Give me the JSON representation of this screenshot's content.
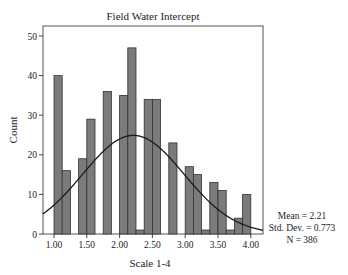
{
  "chart_data": {
    "type": "bar",
    "subtype": "histogram",
    "title": "Field Water Intercept",
    "xlabel": "Scale 1-4",
    "ylabel": "Count",
    "xlim": [
      0.83,
      4.18
    ],
    "ylim": [
      0,
      52
    ],
    "x_ticks": [
      "1.00",
      "1.50",
      "2.00",
      "2.50",
      "3.00",
      "3.50",
      "4.00"
    ],
    "x_tick_values": [
      1.0,
      1.5,
      2.0,
      2.5,
      3.0,
      3.5,
      4.0
    ],
    "y_ticks": [
      0,
      10,
      20,
      30,
      40,
      50
    ],
    "bin_width": 0.125,
    "bin_starts": [
      1.0,
      1.125,
      1.25,
      1.375,
      1.5,
      1.625,
      1.75,
      1.875,
      2.0,
      2.125,
      2.25,
      2.375,
      2.5,
      2.625,
      2.75,
      2.875,
      3.0,
      3.125,
      3.25,
      3.375,
      3.5,
      3.625,
      3.75,
      3.875
    ],
    "values": [
      40,
      16,
      0,
      19,
      29,
      0,
      36,
      0,
      35,
      47,
      1,
      34,
      34,
      0,
      23,
      0,
      17,
      15,
      1,
      13,
      11,
      1,
      4,
      10
    ],
    "normal_curve": {
      "mean": 2.21,
      "std": 0.773,
      "n": 386
    },
    "grid": false,
    "legend": null,
    "stats_text": [
      "Mean = 2.21",
      "Std. Dev. = 0.773",
      "N = 386"
    ],
    "colors": {
      "bar_fill": "#7b7b7b",
      "bar_edge": "#333333",
      "curve": "#1a1a1a",
      "frame": "#555555"
    }
  }
}
